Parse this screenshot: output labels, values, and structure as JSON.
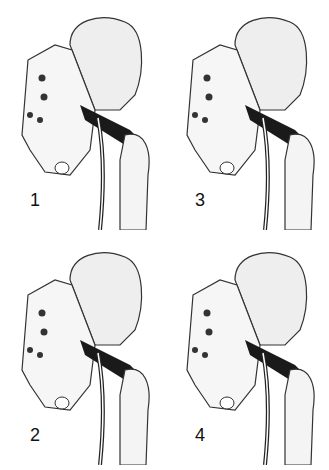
{
  "figure": {
    "panels": [
      {
        "label": "1",
        "x": 0,
        "y": 0
      },
      {
        "label": "3",
        "x": 165,
        "y": 0
      },
      {
        "label": "2",
        "x": 0,
        "y": 235
      },
      {
        "label": "4",
        "x": 165,
        "y": 235
      }
    ],
    "colors": {
      "bone": "#f4f4f4",
      "outline": "#222222",
      "muscle": "#1a1a1a",
      "background": "#ffffff"
    }
  }
}
